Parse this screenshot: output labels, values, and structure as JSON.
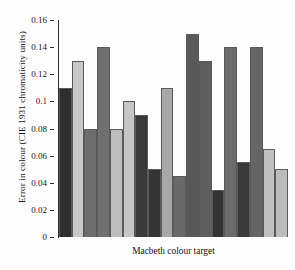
{
  "chart_data": {
    "type": "bar",
    "title": "",
    "subtitle": "",
    "xlabel": "Macbeth colour target",
    "ylabel": "Error in colour (CIE 1931 chromaticity units)",
    "ylim": [
      0,
      0.16
    ],
    "yticks": [
      0,
      0.02,
      0.04,
      0.06,
      0.08,
      0.1,
      0.12,
      0.14,
      0.16
    ],
    "ytick_labels": [
      "0",
      "0.02",
      "0.04",
      "0.06",
      "0.08",
      "0.1",
      "0.12",
      "0.14",
      "0.16"
    ],
    "xticks": [],
    "xtick_labels": [],
    "grid": false,
    "legend": null,
    "legend_position": "none",
    "categories": [
      "1",
      "2",
      "3",
      "4",
      "5",
      "6",
      "7",
      "8",
      "9",
      "10",
      "11",
      "12",
      "13",
      "14",
      "15",
      "16",
      "17",
      "18"
    ],
    "values": [
      0.11,
      0.13,
      0.08,
      0.14,
      0.08,
      0.1,
      0.09,
      0.05,
      0.11,
      0.045,
      0.15,
      0.13,
      0.035,
      0.14,
      0.055,
      0.14,
      0.065,
      0.05
    ],
    "bar_colors": [
      "#2e2e2e",
      "#c8c8c8",
      "#6e6e6e",
      "#707070",
      "#bdbdbd",
      "#c6c6c6",
      "#3a3a3a",
      "#343434",
      "#a8a8a8",
      "#6a6a6a",
      "#595959",
      "#5e5e5e",
      "#333333",
      "#6b6b6b",
      "#3a3a3a",
      "#656565",
      "#c0c0c0",
      "#bcbcbc"
    ],
    "bar_edge_color": "#5a5a5a",
    "background_color": "#fdfdfd",
    "axis_color": "#2b2b2b"
  }
}
